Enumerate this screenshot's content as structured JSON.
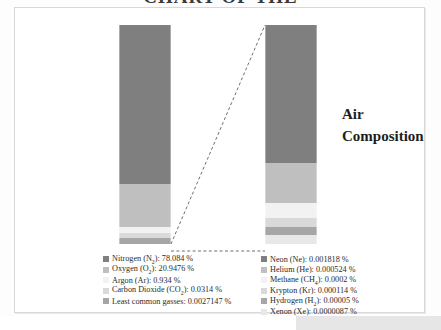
{
  "document": {
    "title_cropped": "CHART OF THE"
  },
  "figure": {
    "heading_line1": "Air",
    "heading_line2": "Composition"
  },
  "chart_data": {
    "type": "bar",
    "title": "Air Composition",
    "subtype": "stacked-column with exploded detail column",
    "xlabel": "",
    "ylabel": "",
    "ylim": [
      0,
      100
    ],
    "grid": false,
    "legend_position": "bottom",
    "columns": [
      {
        "name": "Main composition",
        "total_percent": 100,
        "segments": [
          {
            "label": "Nitrogen (N2)",
            "value": 78.084,
            "color": "#7f7f7f"
          },
          {
            "label": "Oxygen (O2)",
            "value": 20.9476,
            "color": "#bfbfbf"
          },
          {
            "label": "Argon (Ar)",
            "value": 0.934,
            "color": "#f2f2f2"
          },
          {
            "label": "Carbon Dioxide (CO2)",
            "value": 0.0314,
            "color": "#d9d9d9"
          },
          {
            "label": "Least common gasses",
            "value": 0.0027147,
            "color": "#a6a6a6"
          }
        ]
      },
      {
        "name": "Least common gasses (exploded)",
        "total_percent": 0.0027147,
        "segments": [
          {
            "label": "Neon (Ne)",
            "value": 0.001818,
            "color": "#7f7f7f"
          },
          {
            "label": "Helium (He)",
            "value": 0.000524,
            "color": "#bfbfbf"
          },
          {
            "label": "Methane (CH4)",
            "value": 0.0002,
            "color": "#f2f2f2"
          },
          {
            "label": "Krypton (Kr)",
            "value": 0.000114,
            "color": "#d9d9d9"
          },
          {
            "label": "Hydrogen (H2)",
            "value": 5e-05,
            "color": "#a6a6a6"
          },
          {
            "label": "Xenon (Xe)",
            "value": 8.7e-06,
            "color": "#e8e8e8"
          }
        ]
      }
    ]
  },
  "legend_left": {
    "rows": [
      {
        "label": "Nitrogen (N",
        "sub": "2",
        "tail": "): 78.084 %",
        "color": "#7f7f7f"
      },
      {
        "label": "Oxygen (O",
        "sub": "2",
        "tail": "): 20.9476 %",
        "color": "#bfbfbf"
      },
      {
        "label": "Argon (Ar): 0.934 %",
        "sub": "",
        "tail": "",
        "color": "#f2f2f2"
      },
      {
        "label": "Carbon Dioxide (CO",
        "sub": "2",
        "tail": "): 0.0314 %",
        "color": "#d9d9d9"
      },
      {
        "label": "Least common gasses: 0.0027147 %",
        "sub": "",
        "tail": "",
        "color": "#a6a6a6"
      }
    ]
  },
  "legend_right": {
    "rows": [
      {
        "label": "Neon (Ne): 0.001818 %",
        "sub": "",
        "tail": "",
        "color": "#7f7f7f"
      },
      {
        "label": "Helium (He): 0.000524 %",
        "sub": "",
        "tail": "",
        "color": "#bfbfbf"
      },
      {
        "label": "Methane (CH",
        "sub": "4",
        "tail": "): 0.0002 %",
        "color": "#f2f2f2"
      },
      {
        "label": "Krypton (Kr): 0.000114 %",
        "sub": "",
        "tail": "",
        "color": "#d9d9d9"
      },
      {
        "label": "Hydrogen (H",
        "sub": "2",
        "tail": "): 0.00005 %",
        "color": "#a6a6a6"
      },
      {
        "label": "Xenon (Xe): 0.0000087 %",
        "sub": "",
        "tail": "",
        "color": "#e8e8e8"
      }
    ]
  }
}
